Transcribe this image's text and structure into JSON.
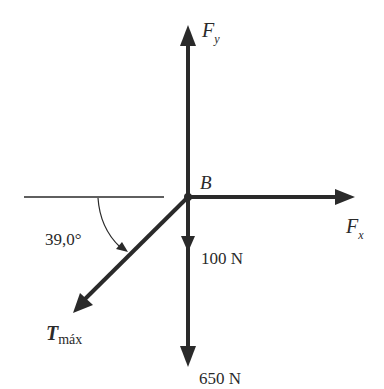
{
  "diagram": {
    "type": "free-body diagram",
    "point": {
      "label": "B"
    },
    "forces": [
      {
        "name": "Fy",
        "label_main": "F",
        "label_sub": "y",
        "direction": "up"
      },
      {
        "name": "Fx",
        "label_main": "F",
        "label_sub": "x",
        "direction": "right"
      },
      {
        "name": "100N",
        "label": "100 N",
        "direction": "down"
      },
      {
        "name": "650N",
        "label": "650 N",
        "direction": "down"
      },
      {
        "name": "Tmax",
        "label_main": "T",
        "label_sub": "máx",
        "direction": "down-left"
      }
    ],
    "angle": {
      "label": "39,0°",
      "reference": "horizontal"
    },
    "colors": {
      "stroke": "#2a2a2a",
      "background": "#ffffff"
    }
  }
}
